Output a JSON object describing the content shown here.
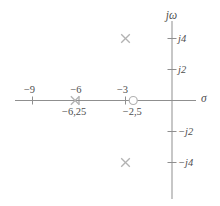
{
  "chart_data": {
    "type": "scatter",
    "subtype": "pole-zero-plot",
    "title": "",
    "x_axis": {
      "label": "σ",
      "ticks": [
        {
          "v": -9,
          "t": "−9"
        },
        {
          "v": -6,
          "t": "−6"
        },
        {
          "v": -3,
          "t": "−3"
        }
      ],
      "range": [
        -10.1,
        1.6
      ]
    },
    "y_axis": {
      "label": "jω",
      "ticks": [
        {
          "v": 4,
          "t": "j4"
        },
        {
          "v": 2,
          "t": "j2"
        },
        {
          "v": -2,
          "t": "−j2"
        },
        {
          "v": -4,
          "t": "−j4"
        }
      ],
      "range": [
        -6.4,
        5.1
      ]
    },
    "series": [
      {
        "name": "poles",
        "marker": "x",
        "points": [
          {
            "re": -3,
            "im": 4,
            "label": ""
          },
          {
            "re": -3,
            "im": -4,
            "label": ""
          },
          {
            "re": -6.25,
            "im": 0,
            "label": "−6,25"
          }
        ]
      },
      {
        "name": "zeros",
        "marker": "circle",
        "points": [
          {
            "re": -2.5,
            "im": 0,
            "label": "−2,5"
          }
        ]
      }
    ],
    "grid": false,
    "legend": false,
    "colors": {
      "axis": "#8f8f8f",
      "marker": "#b2b2b2",
      "text": "#4e4e4e",
      "background": "#ffffff"
    }
  }
}
